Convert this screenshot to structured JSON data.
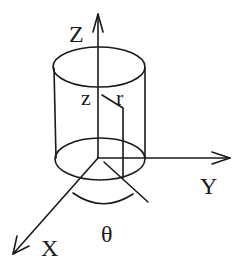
{
  "diagram": {
    "type": "cylindrical-coordinate-system",
    "stroke_color": "#1a1a1a",
    "background": "#ffffff",
    "labels": {
      "z_axis": "Z",
      "y_axis": "Y",
      "x_axis": "X",
      "z_coord": "z",
      "r_coord": "r",
      "theta": "θ"
    }
  }
}
